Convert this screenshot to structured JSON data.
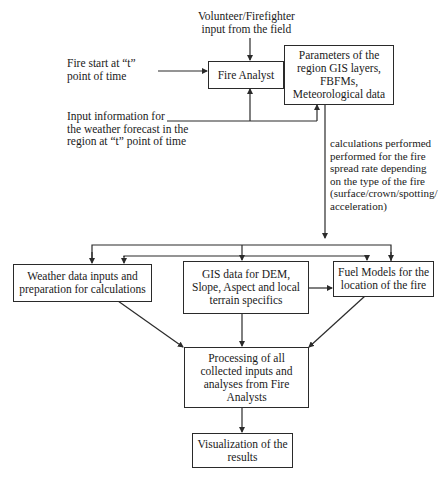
{
  "diagram": {
    "nodes": {
      "volunteer_input": {
        "text": "Volunteer/Firefighter\ninput from the field"
      },
      "fire_start": {
        "text": "Fire start at “t”\npoint of time"
      },
      "weather_forecast_input": {
        "text": "Input information for\nthe weather forecast in the\nregion at “t” point of time"
      },
      "fire_analyst": {
        "text": "Fire Analyst"
      },
      "parameters": {
        "text": "Parameters of the region GIS layers, FBFMs, Meteorological data"
      },
      "calculations_note": {
        "text": "calculations performed\n performed for the fire\n spread rate depending\n on the type of the fire\n (surface/crown/spotting/\n acceleration)"
      },
      "weather_data": {
        "text": "Weather data inputs and preparation for calculations"
      },
      "gis_data": {
        "text": "GIS data for DEM, Slope, Aspect and local terrain specifics"
      },
      "fuel_models": {
        "text": "Fuel Models for the location of the fire"
      },
      "processing": {
        "text": "Processing of all collected inputs and analyses from Fire Analysts"
      },
      "visualization": {
        "text": "Visualization of the results"
      }
    },
    "edges": [
      {
        "from": "volunteer_input",
        "to": "fire_analyst"
      },
      {
        "from": "fire_start",
        "to": "fire_analyst"
      },
      {
        "from": "weather_forecast_input",
        "to": "fire_analyst"
      },
      {
        "from": "weather_forecast_input",
        "to": "parameters"
      },
      {
        "from": "parameters",
        "to": "weather_data"
      },
      {
        "from": "parameters",
        "to": "gis_data"
      },
      {
        "from": "parameters",
        "to": "fuel_models"
      },
      {
        "from": "gis_data",
        "to": "fuel_models"
      },
      {
        "from": "weather_data",
        "to": "processing"
      },
      {
        "from": "gis_data",
        "to": "processing"
      },
      {
        "from": "fuel_models",
        "to": "processing"
      },
      {
        "from": "processing",
        "to": "visualization"
      }
    ],
    "colors": {
      "line": "#2a2a2a",
      "text": "#1a1a1a",
      "background": "#ffffff"
    }
  }
}
